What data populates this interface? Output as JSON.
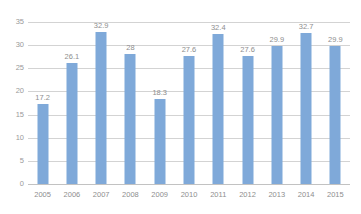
{
  "chart_data": {
    "type": "bar",
    "title": "",
    "xlabel": "",
    "ylabel": "",
    "categories": [
      "2005",
      "2006",
      "2007",
      "2008",
      "2009",
      "2010",
      "2011",
      "2012",
      "2013",
      "2014",
      "2015"
    ],
    "values": [
      17.2,
      26.1,
      32.9,
      28,
      18.3,
      27.6,
      32.4,
      27.6,
      29.9,
      32.7,
      29.9
    ],
    "data_labels": [
      "17.2",
      "26.1",
      "32.9",
      "28",
      "18.3",
      "27.6",
      "32.4",
      "27.6",
      "29.9",
      "32.7",
      "29.9"
    ],
    "ylim": [
      0,
      35
    ],
    "ytick_values": [
      0,
      5,
      10,
      15,
      20,
      25,
      30,
      35
    ],
    "ytick_labels": [
      "0",
      "5",
      "10",
      "15",
      "20",
      "25",
      "30",
      "35"
    ],
    "grid": "horizontal",
    "legend": "none",
    "series": [
      {
        "name": "",
        "values": [
          17.2,
          26.1,
          32.9,
          28,
          18.3,
          27.6,
          32.4,
          27.6,
          29.9,
          32.7,
          29.9
        ]
      }
    ],
    "colors": {
      "bar": "#7fa9d9",
      "gridline": "#d3d3d3",
      "axis_text": "#8e8e8e",
      "background": "#ffffff"
    }
  }
}
